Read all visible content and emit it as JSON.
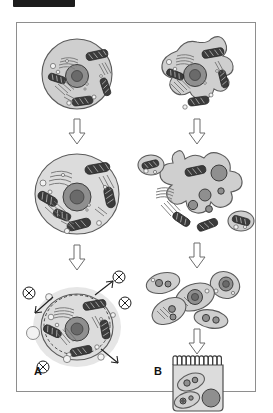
{
  "header": {
    "redaction_bar_label": "redacted-header-bar"
  },
  "figure": {
    "panels": [
      {
        "id": "A",
        "label": "A",
        "title": "Round cell maturation and secretion pathway",
        "stages": [
          {
            "name": "stage-a1",
            "description": "Small round animal cell with nucleus, nucleolus, mitochondria, Golgi apparatus, endoplasmic reticulum and vesicles",
            "shape": "round",
            "organelles": [
              "nucleus",
              "nucleolus",
              "mitochondria",
              "golgi",
              "rough-er",
              "vesicles"
            ]
          },
          {
            "name": "stage-a2",
            "description": "Enlarged round cell with more numerous and darker mitochondria and expanded endoplasmic reticulum",
            "shape": "round-enlarged",
            "organelles": [
              "nucleus",
              "nucleolus",
              "mitochondria",
              "golgi",
              "rough-er",
              "vesicles"
            ]
          },
          {
            "name": "stage-a3",
            "description": "Mature secretory round cell surrounded by a halo, with dashed membrane boundary, exocytosis vesicles and outward signalling arrows terminating in circled-X symbols",
            "shape": "round-secreting",
            "organelles": [
              "nucleus",
              "nucleolus",
              "mitochondria",
              "golgi",
              "rough-er",
              "vesicles",
              "halo",
              "exocytosis-vesicles"
            ],
            "signal_markers": 4,
            "signal_arrows": 3
          }
        ],
        "arrows": [
          {
            "name": "arrow-a1-a2",
            "direction": "down"
          },
          {
            "name": "arrow-a2-a3",
            "direction": "down"
          }
        ]
      },
      {
        "id": "B",
        "label": "B",
        "title": "Amoeboid cell fragmentation and epithelial tissue formation",
        "stages": [
          {
            "name": "stage-b1",
            "description": "Irregular amoeboid cell with lobed pseudopodia containing nucleus, mitochondria, Golgi and endoplasmic reticulum",
            "shape": "amoeboid",
            "organelles": [
              "nucleus",
              "nucleolus",
              "mitochondria",
              "golgi",
              "rough-er",
              "vesicles"
            ]
          },
          {
            "name": "stage-b2",
            "description": "Highly branched multilobed amoeboid cell with several dark nuclei, flanked by two detached daughter cells",
            "shape": "amoeboid-branched",
            "organelles": [
              "multiple-nuclei",
              "mitochondria",
              "golgi",
              "rough-er"
            ],
            "detached_cells": 2
          },
          {
            "name": "stage-b3",
            "description": "Cluster of five separated oval daughter cells each containing nuclei and organelles",
            "shape": "cell-cluster",
            "cell_count": 5
          },
          {
            "name": "stage-b4",
            "description": "Columnar epithelial tissue block with a brush border of microvilli along the apical surface, containing two elongated cells and one large round nucleus",
            "shape": "epithelial-block",
            "microvilli_count": 11,
            "internal_cells": 3
          }
        ],
        "arrows": [
          {
            "name": "arrow-b1-b2",
            "direction": "down"
          },
          {
            "name": "arrow-b2-b3",
            "direction": "down"
          },
          {
            "name": "arrow-b3-b4",
            "direction": "down"
          }
        ]
      }
    ]
  },
  "colors": {
    "page_background": "#ffffff",
    "frame_border": "#8e8e8e",
    "header_bar": "#1d1d1d",
    "cytoplasm": "#cfcfcf",
    "cytoplasm_light": "#dcdcdc",
    "nucleus": "#8f8f8f",
    "nucleolus": "#6a6a6a",
    "mitochondria_dark": "#3b3b3b",
    "mitochondria_light": "#9a9a9a",
    "outline": "#5b5b5b",
    "halo": "#e2e2e2",
    "label_text": "#111111"
  }
}
